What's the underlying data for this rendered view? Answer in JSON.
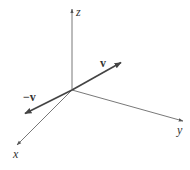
{
  "figure": {
    "origin": [
      72,
      90
    ],
    "axes": {
      "z": {
        "label": "z",
        "end": [
          72,
          8
        ],
        "label_pos": [
          77,
          14
        ]
      },
      "y": {
        "label": "y",
        "end": [
          184,
          121
        ],
        "label_pos": [
          178,
          133
        ]
      },
      "x": {
        "label": "x",
        "end": [
          16,
          146
        ],
        "label_pos": [
          14,
          157
        ]
      }
    },
    "vectors": {
      "v": {
        "label": "v",
        "end": [
          122,
          62
        ],
        "label_pos": [
          100,
          66
        ]
      },
      "neg_v": {
        "label": "−v",
        "end": [
          24,
          114
        ],
        "label_pos": [
          24,
          101
        ]
      }
    },
    "colors": {
      "axis": "#555555",
      "vector": "#444444",
      "text": "#333333"
    }
  }
}
